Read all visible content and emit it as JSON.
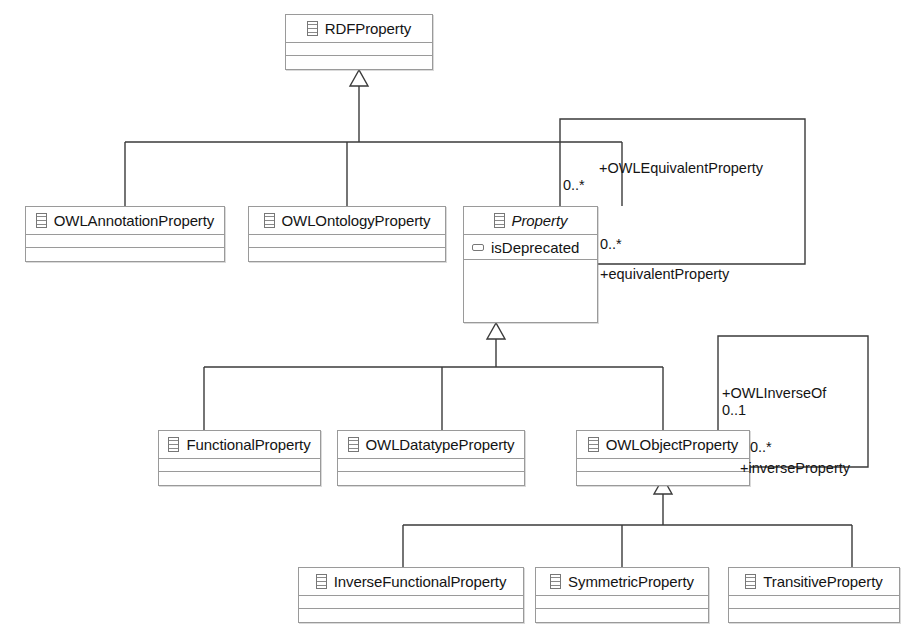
{
  "diagram": {
    "type": "uml-class-diagram",
    "canvas": {
      "width": 909,
      "height": 635
    },
    "colors": {
      "stroke": "#9a9a9a",
      "edge": "#3a3a3a",
      "text": "#141414",
      "fill": "#fefefe"
    }
  },
  "classes": {
    "rdf_property": {
      "name": "RDFProperty",
      "abstract": false,
      "icon": "uml-class-icon",
      "attributes": []
    },
    "owl_annotation_property": {
      "name": "OWLAnnotationProperty",
      "abstract": false,
      "icon": "uml-class-icon",
      "attributes": []
    },
    "owl_ontology_property": {
      "name": "OWLOntologyProperty",
      "abstract": false,
      "icon": "uml-class-icon",
      "attributes": []
    },
    "property": {
      "name": "Property",
      "abstract": true,
      "icon": "uml-class-icon",
      "attributes": [
        {
          "name": "isDeprecated",
          "icon": "uml-attribute-icon"
        }
      ]
    },
    "functional_property": {
      "name": "FunctionalProperty",
      "abstract": false,
      "icon": "uml-class-icon",
      "attributes": []
    },
    "owl_datatype_property": {
      "name": "OWLDatatypeProperty",
      "abstract": false,
      "icon": "uml-class-icon",
      "attributes": []
    },
    "owl_object_property": {
      "name": "OWLObjectProperty",
      "abstract": false,
      "icon": "uml-class-icon",
      "attributes": []
    },
    "inverse_functional_property": {
      "name": "InverseFunctionalProperty",
      "abstract": false,
      "icon": "uml-class-icon",
      "attributes": []
    },
    "symmetric_property": {
      "name": "SymmetricProperty",
      "abstract": false,
      "icon": "uml-class-icon",
      "attributes": []
    },
    "transitive_property": {
      "name": "TransitiveProperty",
      "abstract": false,
      "icon": "uml-class-icon",
      "attributes": []
    }
  },
  "associations": {
    "equivalent_property": {
      "role_top": "+OWLEquivalentProperty",
      "multiplicity_top": "0..*",
      "multiplicity_right": "0..*",
      "role_bottom": "+equivalentProperty",
      "owner": "Property"
    },
    "inverse_of": {
      "role_top": "+OWLInverseOf",
      "multiplicity_top": "0..1",
      "multiplicity_right": "0..*",
      "role_bottom": "+inverseProperty",
      "owner": "OWLObjectProperty"
    }
  },
  "generalizations": [
    {
      "parent": "RDFProperty",
      "children": [
        "OWLAnnotationProperty",
        "OWLOntologyProperty",
        "Property"
      ]
    },
    {
      "parent": "Property",
      "children": [
        "FunctionalProperty",
        "OWLDatatypeProperty",
        "OWLObjectProperty"
      ]
    },
    {
      "parent": "OWLObjectProperty",
      "children": [
        "InverseFunctionalProperty",
        "SymmetricProperty",
        "TransitiveProperty"
      ]
    }
  ]
}
